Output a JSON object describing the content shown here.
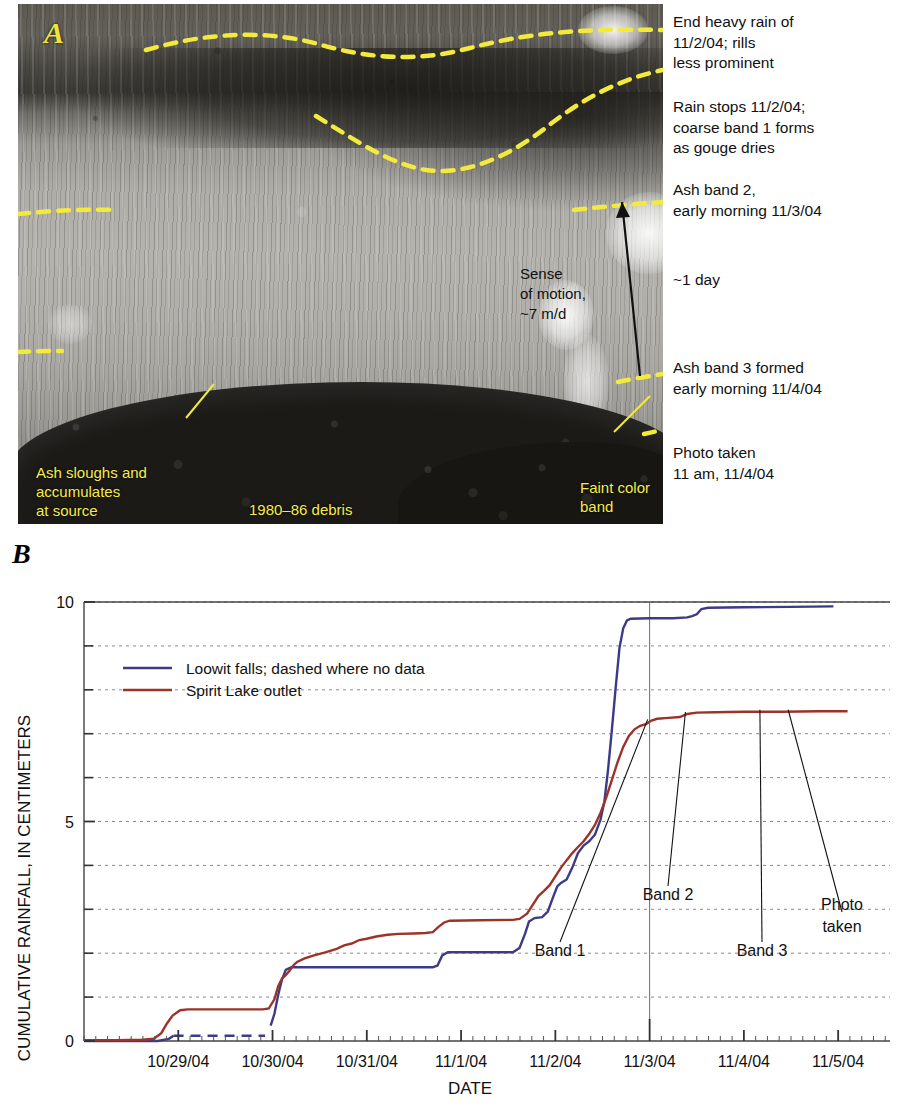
{
  "panel_a": {
    "letter": "A",
    "side_notes": [
      {
        "id": "end-heavy-rain",
        "lines": [
          "End heavy rain of",
          "11/2/04; rills",
          "less prominent"
        ],
        "top": 12
      },
      {
        "id": "rain-stops",
        "lines": [
          "Rain stops 11/2/04;",
          "coarse band 1 forms",
          "as gouge dries"
        ],
        "top": 97
      },
      {
        "id": "ash-band-2",
        "lines": [
          "Ash band 2,",
          "early morning 11/3/04"
        ],
        "top": 180
      },
      {
        "id": "one-day",
        "lines": [
          "~1 day"
        ],
        "top": 270
      },
      {
        "id": "ash-band-3",
        "lines": [
          "Ash band 3 formed",
          "early morning 11/4/04"
        ],
        "top": 358
      },
      {
        "id": "photo-taken",
        "lines": [
          "Photo taken",
          "11 am, 11/4/04"
        ],
        "top": 443
      }
    ],
    "in_photo_black": {
      "sense_of_motion": [
        "Sense",
        "of motion,",
        "~7 m/d"
      ]
    },
    "in_photo_yellow": {
      "ash_sloughs": [
        "Ash slougs and",
        "accumulates",
        "at source"
      ],
      "ash_sloughs_fixed": [
        "Ash sloughs and",
        "accumulates",
        "at source"
      ],
      "debris": "1980–86 debris",
      "faint_color_band": [
        "Faint color",
        "band"
      ]
    }
  },
  "panel_b": {
    "letter": "B",
    "legend_position": "inside-top-left"
  },
  "chart_data": {
    "type": "line",
    "title": "",
    "xlabel": "DATE",
    "ylabel": "CUMULATIVE RAINFALL, IN CENTIMETERS",
    "ylim": [
      0,
      10
    ],
    "yticks_major": [
      0,
      5,
      10
    ],
    "yticks_minor": [
      1,
      2,
      3,
      4,
      6,
      7,
      8,
      9
    ],
    "grid": "horizontal-dashed",
    "xlim": [
      "10/28/04",
      "11/5/04 12:00"
    ],
    "xtick_labels": [
      "10/29/04",
      "10/30/04",
      "10/31/04",
      "11/1/04",
      "11/2/04",
      "11/3/04",
      "11/4/04",
      "11/5/04"
    ],
    "xtick_values": [
      1.0,
      2.0,
      3.0,
      4.0,
      5.0,
      6.0,
      7.0,
      8.0
    ],
    "reference_line": {
      "label": "11/3/04",
      "x": 6.0
    },
    "annotations": [
      {
        "label": "Band 1",
        "x": 5.98,
        "y": 7.28
      },
      {
        "label": "Band 2",
        "x": 6.38,
        "y": 7.45
      },
      {
        "label": "Band 3",
        "x": 7.17,
        "y": 7.5
      },
      {
        "label": "Photo taken",
        "x": 7.47,
        "y": 7.5
      }
    ],
    "series": [
      {
        "name": "Loowit falls; dashed where no data",
        "color": "#3c3b87",
        "style": "solid-with-dashed-gap",
        "dashed_range": [
          0.95,
          1.95
        ],
        "points": [
          [
            0.0,
            0.0
          ],
          [
            0.6,
            0.0
          ],
          [
            0.78,
            0.0
          ],
          [
            0.9,
            0.05
          ],
          [
            0.95,
            0.12
          ],
          [
            1.2,
            0.12
          ],
          [
            1.5,
            0.12
          ],
          [
            1.8,
            0.12
          ],
          [
            1.92,
            0.12
          ],
          [
            1.98,
            0.35
          ],
          [
            2.02,
            0.62
          ],
          [
            2.06,
            1.05
          ],
          [
            2.1,
            1.4
          ],
          [
            2.14,
            1.62
          ],
          [
            2.2,
            1.68
          ],
          [
            2.6,
            1.68
          ],
          [
            3.0,
            1.68
          ],
          [
            3.4,
            1.68
          ],
          [
            3.7,
            1.68
          ],
          [
            3.75,
            1.72
          ],
          [
            3.8,
            1.95
          ],
          [
            3.86,
            2.02
          ],
          [
            4.2,
            2.02
          ],
          [
            4.55,
            2.02
          ],
          [
            4.62,
            2.12
          ],
          [
            4.68,
            2.45
          ],
          [
            4.72,
            2.72
          ],
          [
            4.78,
            2.8
          ],
          [
            4.86,
            2.82
          ],
          [
            4.92,
            2.95
          ],
          [
            4.98,
            3.3
          ],
          [
            5.02,
            3.52
          ],
          [
            5.06,
            3.6
          ],
          [
            5.12,
            3.68
          ],
          [
            5.18,
            3.95
          ],
          [
            5.24,
            4.28
          ],
          [
            5.3,
            4.45
          ],
          [
            5.36,
            4.55
          ],
          [
            5.42,
            4.7
          ],
          [
            5.48,
            5.05
          ],
          [
            5.52,
            5.45
          ],
          [
            5.56,
            6.2
          ],
          [
            5.6,
            7.1
          ],
          [
            5.64,
            8.05
          ],
          [
            5.68,
            8.95
          ],
          [
            5.72,
            9.4
          ],
          [
            5.76,
            9.58
          ],
          [
            5.8,
            9.62
          ],
          [
            6.0,
            9.63
          ],
          [
            6.25,
            9.63
          ],
          [
            6.4,
            9.65
          ],
          [
            6.45,
            9.68
          ],
          [
            6.5,
            9.72
          ],
          [
            6.55,
            9.84
          ],
          [
            6.62,
            9.87
          ],
          [
            7.0,
            9.88
          ],
          [
            7.5,
            9.89
          ],
          [
            7.95,
            9.9
          ]
        ]
      },
      {
        "name": "Spirit Lake outlet",
        "color": "#9c3329",
        "style": "solid",
        "points": [
          [
            0.0,
            0.02
          ],
          [
            0.35,
            0.02
          ],
          [
            0.62,
            0.03
          ],
          [
            0.74,
            0.05
          ],
          [
            0.82,
            0.18
          ],
          [
            0.88,
            0.4
          ],
          [
            0.94,
            0.58
          ],
          [
            1.02,
            0.7
          ],
          [
            1.1,
            0.72
          ],
          [
            1.5,
            0.72
          ],
          [
            1.9,
            0.72
          ],
          [
            1.96,
            0.74
          ],
          [
            2.02,
            0.95
          ],
          [
            2.06,
            1.25
          ],
          [
            2.1,
            1.42
          ],
          [
            2.14,
            1.5
          ],
          [
            2.18,
            1.6
          ],
          [
            2.22,
            1.72
          ],
          [
            2.26,
            1.8
          ],
          [
            2.34,
            1.88
          ],
          [
            2.44,
            1.95
          ],
          [
            2.56,
            2.02
          ],
          [
            2.68,
            2.1
          ],
          [
            2.76,
            2.18
          ],
          [
            2.84,
            2.22
          ],
          [
            2.92,
            2.3
          ],
          [
            3.0,
            2.33
          ],
          [
            3.1,
            2.38
          ],
          [
            3.22,
            2.42
          ],
          [
            3.34,
            2.44
          ],
          [
            3.5,
            2.45
          ],
          [
            3.62,
            2.46
          ],
          [
            3.7,
            2.48
          ],
          [
            3.76,
            2.6
          ],
          [
            3.82,
            2.7
          ],
          [
            3.88,
            2.74
          ],
          [
            4.2,
            2.75
          ],
          [
            4.55,
            2.76
          ],
          [
            4.62,
            2.78
          ],
          [
            4.7,
            2.9
          ],
          [
            4.76,
            3.1
          ],
          [
            4.82,
            3.3
          ],
          [
            4.88,
            3.42
          ],
          [
            4.94,
            3.55
          ],
          [
            5.0,
            3.75
          ],
          [
            5.06,
            3.95
          ],
          [
            5.12,
            4.12
          ],
          [
            5.18,
            4.28
          ],
          [
            5.24,
            4.42
          ],
          [
            5.3,
            4.55
          ],
          [
            5.36,
            4.72
          ],
          [
            5.42,
            4.92
          ],
          [
            5.48,
            5.2
          ],
          [
            5.54,
            5.55
          ],
          [
            5.6,
            5.95
          ],
          [
            5.66,
            6.35
          ],
          [
            5.72,
            6.7
          ],
          [
            5.78,
            6.95
          ],
          [
            5.84,
            7.1
          ],
          [
            5.9,
            7.18
          ],
          [
            5.96,
            7.22
          ],
          [
            6.02,
            7.3
          ],
          [
            6.08,
            7.34
          ],
          [
            6.2,
            7.36
          ],
          [
            6.32,
            7.38
          ],
          [
            6.4,
            7.45
          ],
          [
            6.5,
            7.48
          ],
          [
            6.7,
            7.49
          ],
          [
            7.0,
            7.5
          ],
          [
            7.4,
            7.5
          ],
          [
            7.8,
            7.51
          ],
          [
            8.1,
            7.51
          ]
        ]
      }
    ]
  }
}
